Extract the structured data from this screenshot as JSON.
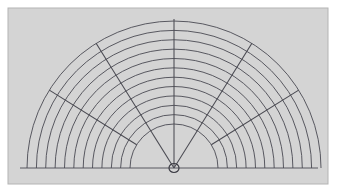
{
  "figure": {
    "type": "technical-line-drawing",
    "canvas": {
      "width": 344,
      "height": 195
    },
    "page_background": "#ffffff",
    "panel": {
      "x": 8,
      "y": 8,
      "width": 320,
      "height": 176,
      "fill": "#d4d4d4",
      "border_color": "#b4b4b4",
      "border_width": 1
    },
    "ink_color": "#4a4a52",
    "stroke_width": 0.9,
    "hub": {
      "cx": 174,
      "cy": 168,
      "rx": 5,
      "ry": 4.5,
      "fill": "none",
      "stroke": "#3c3c44",
      "stroke_width": 1.2,
      "label": "center-hub"
    },
    "baseline": {
      "x1": 20,
      "y1": 168,
      "x2": 318,
      "y2": 168,
      "label": "horizontal-baseline"
    },
    "arcs": {
      "count": 12,
      "label": "concentric-arcs",
      "center_x": 174,
      "center_y": 168,
      "inner_radius": 44,
      "outer_radius": 147,
      "radii": [
        44,
        53.4,
        62.7,
        72.1,
        81.5,
        90.8,
        100.2,
        109.5,
        118.9,
        128.3,
        137.6,
        147
      ],
      "start_angle_deg": 180,
      "end_angle_deg": 0
    },
    "spokes": {
      "count": 5,
      "label": "radial-spokes",
      "center_x": 174,
      "center_y": 168,
      "items": [
        {
          "name": "spoke-left",
          "angle_deg": 180,
          "end_x": 46,
          "end_y": 95,
          "inner_radius": 44,
          "outer_radius": 147
        },
        {
          "name": "spoke-upper-left",
          "angle_deg": 150,
          "end_x": 101,
          "end_y": 40,
          "inner_radius": 0,
          "outer_radius": 147
        },
        {
          "name": "spoke-vertical",
          "angle_deg": 90,
          "end_x": 174,
          "end_y": 19,
          "inner_radius": 0,
          "outer_radius": 149
        },
        {
          "name": "spoke-upper-right",
          "angle_deg": 30,
          "end_x": 248,
          "end_y": 40,
          "inner_radius": 0,
          "outer_radius": 147
        },
        {
          "name": "spoke-right",
          "angle_deg": 0,
          "end_x": 303,
          "end_y": 95,
          "inner_radius": 44,
          "outer_radius": 147
        }
      ],
      "angles_deg": [
        148,
        122,
        90,
        58,
        32
      ]
    }
  }
}
